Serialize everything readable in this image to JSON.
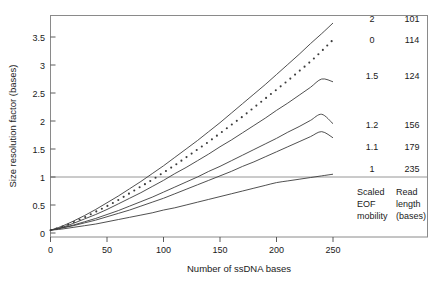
{
  "chart_data": {
    "type": "line",
    "title": "",
    "xlabel": "Number of ssDNA bases",
    "ylabel": "Size resolution factor (bases)",
    "xlim": [
      0,
      260
    ],
    "ylim": [
      0,
      3.78
    ],
    "xticks": [
      0,
      50,
      100,
      150,
      200,
      250
    ],
    "xticklabels": [
      "0",
      "50",
      "100",
      "150",
      "200",
      "250"
    ],
    "yticks": [
      0,
      0.5,
      1,
      1.5,
      2,
      2.5,
      3,
      3.5
    ],
    "yticklabels": [
      "0",
      "0.5",
      "1",
      "1.5",
      "2",
      "2.5",
      "3",
      "3.5"
    ],
    "grid": false,
    "reference_line": {
      "y": 1,
      "label": "",
      "orientation": "horizontal"
    },
    "legend_position": "right",
    "legend_headers": [
      "Scaled EOF mobility",
      "Read length (bases)"
    ],
    "x": [
      0,
      10,
      20,
      30,
      40,
      50,
      60,
      70,
      80,
      90,
      100,
      110,
      120,
      130,
      140,
      150,
      160,
      170,
      180,
      190,
      200,
      210,
      220,
      230,
      240,
      250
    ],
    "series": [
      {
        "name": "2",
        "read_length": 101,
        "style": "solid",
        "label": "2",
        "values": [
          0.05,
          0.12,
          0.21,
          0.31,
          0.42,
          0.54,
          0.66,
          0.79,
          0.92,
          1.06,
          1.2,
          1.35,
          1.5,
          1.65,
          1.81,
          1.97,
          2.14,
          2.31,
          2.48,
          2.65,
          2.83,
          3.01,
          3.19,
          3.38,
          3.56,
          3.75
        ]
      },
      {
        "name": "0",
        "read_length": 114,
        "style": "dotted",
        "label": "0",
        "values": [
          0.05,
          0.11,
          0.19,
          0.28,
          0.38,
          0.48,
          0.59,
          0.71,
          0.83,
          0.95,
          1.08,
          1.21,
          1.35,
          1.49,
          1.63,
          1.78,
          1.93,
          2.08,
          2.24,
          2.4,
          2.56,
          2.72,
          2.89,
          3.06,
          3.25,
          3.45
        ]
      },
      {
        "name": "1.5",
        "read_length": 124,
        "style": "solid",
        "label": "1.5",
        "values": [
          0.05,
          0.1,
          0.17,
          0.25,
          0.33,
          0.42,
          0.52,
          0.62,
          0.72,
          0.83,
          0.94,
          1.06,
          1.17,
          1.29,
          1.41,
          1.54,
          1.66,
          1.79,
          1.92,
          2.05,
          2.19,
          2.32,
          2.46,
          2.6,
          2.75,
          2.7
        ]
      },
      {
        "name": "1.2",
        "read_length": 156,
        "style": "solid",
        "label": "1.2",
        "values": [
          0.05,
          0.09,
          0.14,
          0.2,
          0.26,
          0.33,
          0.4,
          0.48,
          0.56,
          0.64,
          0.73,
          0.82,
          0.91,
          1.0,
          1.1,
          1.19,
          1.29,
          1.39,
          1.49,
          1.59,
          1.69,
          1.8,
          1.9,
          2.01,
          2.12,
          1.95
        ]
      },
      {
        "name": "1.1",
        "read_length": 179,
        "style": "solid",
        "label": "1.1",
        "values": [
          0.05,
          0.09,
          0.13,
          0.18,
          0.23,
          0.29,
          0.35,
          0.41,
          0.48,
          0.55,
          0.62,
          0.7,
          0.78,
          0.86,
          0.94,
          1.02,
          1.1,
          1.19,
          1.27,
          1.36,
          1.45,
          1.54,
          1.63,
          1.72,
          1.81,
          1.7
        ]
      },
      {
        "name": "1",
        "read_length": 235,
        "style": "solid",
        "label": "1",
        "values": [
          0.05,
          0.07,
          0.1,
          0.13,
          0.16,
          0.2,
          0.24,
          0.28,
          0.32,
          0.36,
          0.41,
          0.45,
          0.5,
          0.55,
          0.6,
          0.65,
          0.7,
          0.75,
          0.8,
          0.85,
          0.9,
          0.93,
          0.96,
          0.99,
          1.02,
          1.05
        ]
      }
    ]
  },
  "legend": {
    "column1": {
      "line1": "Scaled",
      "line2": "EOF",
      "line3": "mobility"
    },
    "column2": {
      "line1": "Read",
      "line2": "length",
      "line3": "(bases)"
    },
    "rows": [
      {
        "mobility": "2",
        "read_length": "101"
      },
      {
        "mobility": "0",
        "read_length": "114"
      },
      {
        "mobility": "1.5",
        "read_length": "124"
      },
      {
        "mobility": "1.2",
        "read_length": "156"
      },
      {
        "mobility": "1.1",
        "read_length": "179"
      },
      {
        "mobility": "1",
        "read_length": "235"
      }
    ]
  }
}
